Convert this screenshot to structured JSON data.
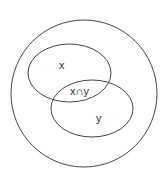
{
  "diagram": {
    "type": "venn",
    "universe": {
      "label": ""
    },
    "sets": [
      {
        "id": "x",
        "label": "x"
      },
      {
        "id": "y",
        "label": "y"
      }
    ],
    "intersection": {
      "label": "x∩y"
    },
    "stroke_color": "#444444",
    "background": "#ffffff"
  }
}
